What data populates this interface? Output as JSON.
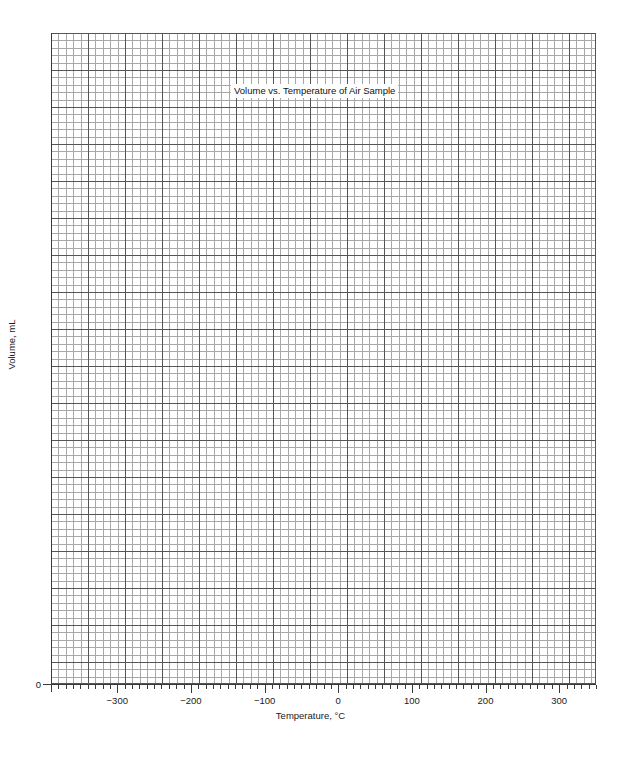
{
  "chart_data": {
    "type": "scatter",
    "title": "Volume vs. Temperature of Air Sample",
    "xlabel": "Temperature, °C",
    "ylabel": "Volume, mL",
    "xlim": [
      -390,
      350
    ],
    "ylim": [
      0,
      880
    ],
    "x_major_ticks": [
      -300,
      -200,
      -100,
      0,
      100,
      200,
      300
    ],
    "x_major_tick_labels": [
      "−300",
      "−200",
      "−100",
      "0",
      "100",
      "200",
      "300"
    ],
    "x_minor_tick_step": 10,
    "y_major_ticks": [
      0
    ],
    "y_major_tick_labels": [
      "0"
    ],
    "grid": "graph-paper: minor cells every 10 units, heavy rule every 5 cells",
    "grid_minor_color": "#a8a8a8",
    "grid_major_color": "#555555",
    "axis_color": "#3a3a3a",
    "background_color": "#ffffff",
    "series": [],
    "annotations": [],
    "legend": null
  },
  "figure": {
    "title": "Volume vs. Temperature of Air Sample",
    "x_axis": {
      "label": "Temperature, °C",
      "ticks": [
        {
          "value": -300,
          "label": "−300"
        },
        {
          "value": -200,
          "label": "−200"
        },
        {
          "value": -100,
          "label": "−100"
        },
        {
          "value": 0,
          "label": "0"
        },
        {
          "value": 100,
          "label": "100"
        },
        {
          "value": 200,
          "label": "200"
        },
        {
          "value": 300,
          "label": "300"
        }
      ]
    },
    "y_axis": {
      "label": "Volume, mL",
      "ticks": [
        {
          "value": 0,
          "label": "0"
        }
      ]
    }
  }
}
